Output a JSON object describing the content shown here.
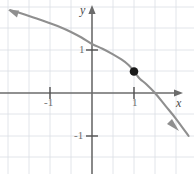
{
  "figure": {
    "axis_label_x": "x",
    "axis_label_y": "y",
    "tick_x_neg1": "-1",
    "tick_x_pos1": "1",
    "tick_y_pos1": "1",
    "tick_y_neg1": "-1",
    "grid_color": "#d9dde4",
    "axis_color": "#6b6b6b",
    "curve_color": "#8a8a8a",
    "point_color": "#1a1a1a"
  },
  "chart_data": {
    "type": "line",
    "title": "",
    "xlabel": "x",
    "ylabel": "y",
    "xlim": [
      -1.95,
      2.3
    ],
    "ylim": [
      -1.9,
      1.95
    ],
    "grid": true,
    "grid_step": 0.5,
    "legend": null,
    "xticks": [
      -1,
      1
    ],
    "xtick_labels": [
      "-1",
      "1"
    ],
    "yticks": [
      -1,
      1
    ],
    "ytick_labels": [
      "-1",
      "1"
    ],
    "series": [
      {
        "name": "curve",
        "description": "decreasing cube-root shaped curve with vertical tangent inflection at (1, 0.5), arrowheads at both ends",
        "x": [
          -1.95,
          -1.75,
          -1.5,
          -1.25,
          -1.0,
          -0.75,
          -0.5,
          -0.25,
          0.0,
          0.25,
          0.5,
          0.7,
          0.85,
          0.93,
          0.97,
          0.99,
          1.0,
          1.01,
          1.03,
          1.07,
          1.15,
          1.3,
          1.5,
          1.75,
          2.0,
          2.3
        ],
        "y": [
          1.93,
          1.87,
          1.79,
          1.71,
          1.62,
          1.53,
          1.42,
          1.29,
          1.14,
          1.03,
          0.9,
          0.78,
          0.67,
          0.59,
          0.54,
          0.52,
          0.5,
          0.48,
          0.46,
          0.41,
          0.32,
          0.2,
          0.0,
          -0.3,
          -0.6,
          -1.0
        ]
      }
    ],
    "annotations": [
      {
        "type": "point",
        "x": 1.0,
        "y": 0.5,
        "label": "",
        "filled": true
      }
    ]
  }
}
